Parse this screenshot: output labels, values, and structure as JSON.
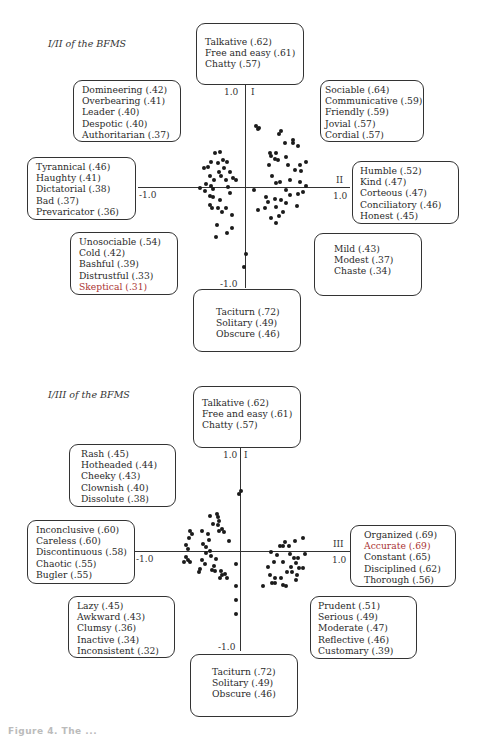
{
  "panels": [
    {
      "title": "I/II of the BFMS",
      "axes": {
        "vertical_label": "I",
        "horizontal_label": "II",
        "top_tick": "1.0",
        "bottom_tick": "-1.0",
        "left_tick": "-1.0",
        "right_tick": "1.0"
      },
      "boxes": {
        "top": [
          "Talkative (.62)",
          "Free and easy (.61)",
          "Chatty (.57)"
        ],
        "upper_left": [
          "Domineering (.42)",
          "Overbearing (.41)",
          "Leader (.40)",
          "Despotic (.40)",
          "Authoritarian (.37)"
        ],
        "upper_right": [
          "Sociable (.64)",
          "Communicative (.59)",
          "Friendly (.59)",
          "Jovial (.57)",
          "Cordial (.57)"
        ],
        "left": [
          "Tyrannical (.46)",
          "Haughty (.41)",
          "Dictatorial (.38)",
          "Bad (.37)",
          "Prevaricator (.36)"
        ],
        "right": [
          "Humble (.52)",
          "Kind (.47)",
          "Corteous (.47)",
          "Conciliatory (.46)",
          "Honest (.45)"
        ],
        "lower_left": [
          "Unosociable (.54)",
          "Cold (.42)",
          "Bashful (.39)",
          "Distrustful (.33)",
          "Skeptical (.31)"
        ],
        "lower_right": [
          "Mild (.43)",
          "Modest (.37)",
          "Chaste (.34)"
        ],
        "bottom": [
          "Taciturn (.72)",
          "Solitary (.49)",
          "Obscure (.46)"
        ]
      }
    },
    {
      "title": "I/III of the BFMS",
      "axes": {
        "vertical_label": "I",
        "horizontal_label": "III",
        "top_tick": "1.0",
        "bottom_tick": "-1.0",
        "left_tick": "-1.0",
        "right_tick": "1.0"
      },
      "boxes": {
        "top": [
          "Talkative (.62)",
          "Free and easy (.61)",
          "Chatty (.57)"
        ],
        "upper_left": [
          "Rash (.45)",
          "Hotheaded (.44)",
          "Cheeky (.43)",
          "Clownish (.40)",
          "Dissolute (.38)"
        ],
        "left": [
          "Inconclusive (.60)",
          "Careless (.60)",
          "Discontinuous (.58)",
          "Chaotic (.55)",
          "Bugler (.55)"
        ],
        "right": [
          "Organized (.69)",
          "Accurate (.69)",
          "Constant (.65)",
          "Disciplined (.62)",
          "Thorough (.56)"
        ],
        "lower_left": [
          "Lazy (.45)",
          "Awkward (.43)",
          "Clumsy (.36)",
          "Inactive (.34)",
          "Inconsistent (.32)"
        ],
        "lower_right": [
          "Prudent (.51)",
          "Serious (.49)",
          "Moderate (.47)",
          "Reflective (.46)",
          "Customary (.39)"
        ],
        "bottom": [
          "Taciturn (.72)",
          "Solitary (.49)",
          "Obscure (.46)"
        ]
      }
    }
  ],
  "caption": "Figure 4.  The ..."
}
